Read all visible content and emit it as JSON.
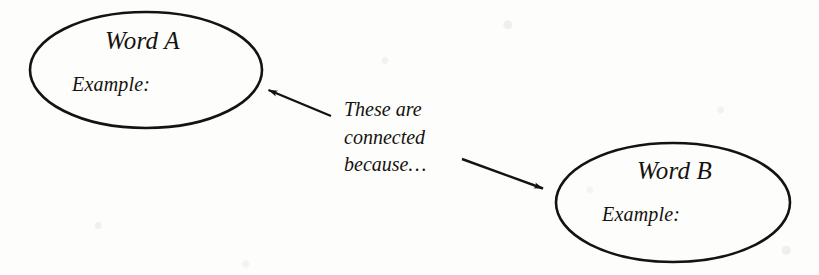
{
  "page": {
    "width": 819,
    "height": 275,
    "background_color": "#fdfdfc",
    "ink_color": "#15130f"
  },
  "nodes": [
    {
      "id": "word-a",
      "title": "Word A",
      "example_label": "Example:",
      "shape": "ellipse",
      "cx": 146,
      "cy": 70,
      "rx": 116,
      "ry": 58
    },
    {
      "id": "word-b",
      "title": "Word B",
      "example_label": "Example:",
      "shape": "ellipse",
      "cx": 673,
      "cy": 202.5,
      "rx": 117,
      "ry": 59.5
    }
  ],
  "connector": {
    "caption_lines": [
      "These are",
      "connected",
      "because…"
    ],
    "arrows": [
      {
        "id": "arrow-to-word-a",
        "from_x": 331,
        "from_y": 116,
        "to_x": 266,
        "to_y": 89,
        "points_to": "word-a"
      },
      {
        "id": "arrow-to-word-b",
        "from_x": 462,
        "from_y": 159,
        "to_x": 546,
        "to_y": 190,
        "points_to": "word-b"
      }
    ]
  }
}
